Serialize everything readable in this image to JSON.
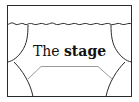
{
  "diagram": {
    "title_plain": "The",
    "title_bold": "stage",
    "colors": {
      "frame": "#2a2a2a",
      "curtain": "#2a2a2a",
      "floor": "#9a9a9a",
      "text": "#111111",
      "background": "#ffffff"
    },
    "elements": [
      "frame",
      "valance",
      "left-curtain",
      "right-curtain",
      "stage-floor",
      "caption"
    ]
  }
}
